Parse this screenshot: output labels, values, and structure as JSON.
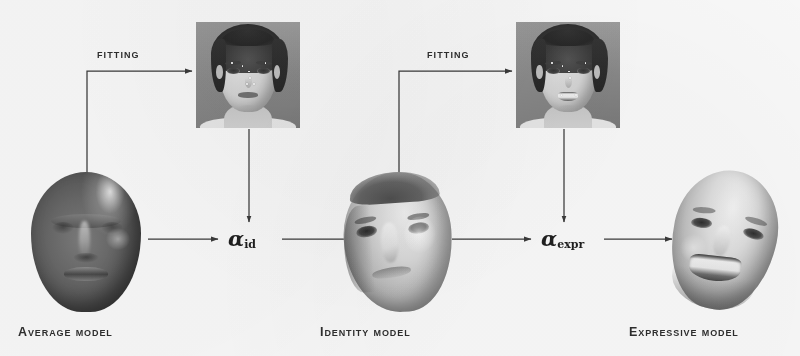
{
  "figure": {
    "background_color": "#f8f7f4",
    "ink_color": "#2e2e2e"
  },
  "stages": [
    {
      "id": "average-model",
      "caption": "Average Model",
      "description": "dark gray neutral 3D average face mask"
    },
    {
      "id": "identity-model",
      "caption": "Identity Model",
      "description": "textured neutral identity 3D face mask"
    },
    {
      "id": "expressive-model",
      "caption": "Expressive Model",
      "description": "textured smiling expressive 3D face mask"
    }
  ],
  "photos": [
    {
      "id": "neutral-photo",
      "description": "grayscale photograph of a woman with neutral expression and fitted landmarks"
    },
    {
      "id": "smiling-photo",
      "description": "grayscale photograph of the same woman smiling with fitted landmarks"
    }
  ],
  "edges": [
    {
      "id": "fitting-1",
      "label": "Fitting"
    },
    {
      "id": "fitting-2",
      "label": "Fitting"
    }
  ],
  "parameters": [
    {
      "id": "alpha-id",
      "symbol": "α",
      "subscript": "id"
    },
    {
      "id": "alpha-expr",
      "symbol": "α",
      "subscript": "expr"
    }
  ],
  "icons": {
    "arrow": "arrowhead-right",
    "arrow_down": "arrowhead-down"
  }
}
